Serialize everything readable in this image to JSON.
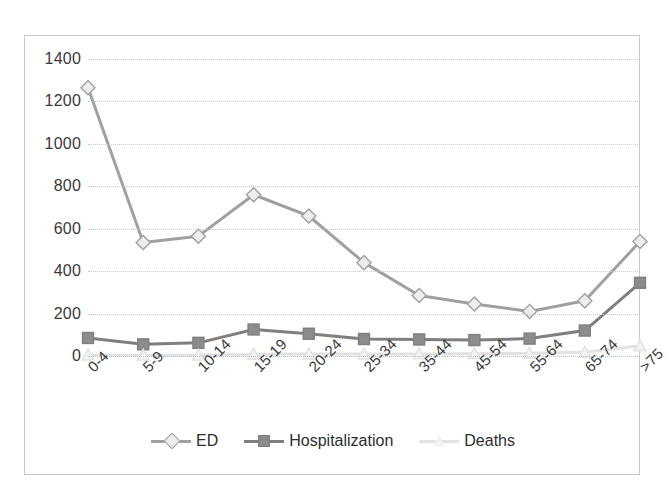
{
  "chart_data": {
    "type": "line",
    "title": "",
    "xlabel": "",
    "ylabel": "",
    "categories": [
      "0-4",
      "5-9",
      "10-14",
      "15-19",
      "20-24",
      "25-34",
      "35-44",
      "45-54",
      "55-64",
      "65-74",
      ">75"
    ],
    "ylim": [
      0,
      1400
    ],
    "yticks": [
      0,
      200,
      400,
      600,
      800,
      1000,
      1200,
      1400
    ],
    "grid": true,
    "legend_position": "bottom",
    "series": [
      {
        "name": "ED",
        "marker": "diamond",
        "color": "#a0a0a0",
        "marker_fill": "#ededed",
        "values": [
          1265,
          535,
          565,
          760,
          660,
          440,
          285,
          245,
          210,
          260,
          540
        ]
      },
      {
        "name": "Hospitalization",
        "marker": "square",
        "color": "#7f7f7f",
        "marker_fill": "#8c8c8c",
        "values": [
          85,
          55,
          62,
          125,
          105,
          80,
          78,
          75,
          82,
          120,
          345
        ]
      },
      {
        "name": "Deaths",
        "marker": "triangle",
        "color": "#e2e2e2",
        "marker_fill": "#f2f2f2",
        "values": [
          5,
          4,
          4,
          8,
          9,
          9,
          10,
          11,
          13,
          18,
          48
        ]
      }
    ]
  },
  "legend": {
    "items": [
      {
        "label": "ED"
      },
      {
        "label": "Hospitalization"
      },
      {
        "label": "Deaths"
      }
    ]
  }
}
